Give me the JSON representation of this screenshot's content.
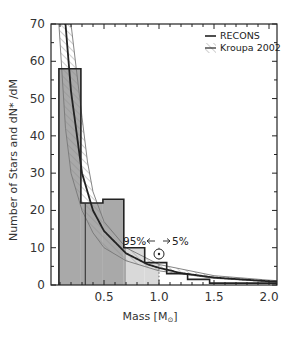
{
  "chart_data": {
    "type": "bar",
    "title": "",
    "xlabel": "Mass [M☉]",
    "ylabel": "Number of Stars and dN* /dM",
    "xlim": [
      0.02,
      2.1
    ],
    "ylim": [
      0,
      70
    ],
    "x_ticks": [
      0.5,
      1.0,
      1.5,
      2.0
    ],
    "x_tick_labels": [
      "0.5",
      "1.0",
      "1.5",
      "2.0"
    ],
    "y_ticks": [
      0,
      10,
      20,
      30,
      40,
      50,
      60,
      70
    ],
    "y_tick_labels": [
      "0",
      "10",
      "20",
      "30",
      "40",
      "50",
      "60",
      "70"
    ],
    "grid": false,
    "legend_position": "top-right",
    "series": [
      {
        "name": "RECONS",
        "kind": "histogram",
        "bin_edges": [
          0.09,
          0.29,
          0.49,
          0.68,
          0.87,
          1.07,
          1.26,
          1.46,
          2.07
        ],
        "values": [
          58,
          22,
          23,
          10,
          6,
          3,
          1.5,
          0.5
        ]
      },
      {
        "name": "RECONS fit",
        "kind": "line",
        "x": [
          0.15,
          0.2,
          0.3,
          0.4,
          0.5,
          0.7,
          0.9,
          1.0,
          1.2,
          1.5,
          2.0,
          2.1
        ],
        "y": [
          70,
          52,
          30,
          20,
          14.5,
          8.5,
          5.5,
          4.6,
          3.2,
          2.0,
          1.0,
          0.9
        ]
      },
      {
        "name": "Kroupa 2002",
        "kind": "band",
        "x": [
          0.09,
          0.15,
          0.2,
          0.3,
          0.35,
          0.4,
          0.5,
          0.7,
          1.0,
          1.5,
          2.0,
          2.1
        ],
        "lower": [
          70,
          42,
          30,
          20,
          17,
          14,
          10,
          6.5,
          3.8,
          1.8,
          0.9,
          0.8
        ],
        "upper": [
          70,
          70,
          70,
          45,
          33,
          25,
          17,
          10,
          5.5,
          2.5,
          1.3,
          1.1
        ]
      }
    ],
    "shaded_regions": [
      {
        "x_from": 0.09,
        "x_to": 0.7,
        "shade": "dark-gray"
      },
      {
        "x_from": 0.7,
        "x_to": 1.0,
        "shade": "light-gray"
      }
    ],
    "annotations": [
      {
        "text": "95%",
        "x": 0.85,
        "y": 11
      },
      {
        "text": "5%",
        "x": 1.15,
        "y": 11
      },
      {
        "text": "⊙",
        "x": 1.0,
        "y": 7.5,
        "note": "Sun symbol at 1 solar mass, dotted vertical line"
      }
    ],
    "vertical_lines": [
      {
        "x": 0.33,
        "style": "solid-thin"
      },
      {
        "x": 1.0,
        "style": "dotted"
      }
    ]
  },
  "legend": {
    "items": [
      {
        "label": "RECONS",
        "swatch": "line"
      },
      {
        "label": "Kroupa 2002",
        "swatch": "hatched"
      }
    ]
  },
  "annotations": {
    "left_pct": "95%",
    "right_pct": "5%",
    "sun_symbol": "⊙"
  },
  "axes": {
    "xlabel_main": "Mass [M",
    "xlabel_sub": "⊙",
    "xlabel_end": "]",
    "ylabel": "Number of Stars and dN* /dM"
  },
  "colors": {
    "dark_fill": "#a9a9a9",
    "light_fill": "#d9d9d9",
    "line": "#222222",
    "hatch": "#8a8a8a"
  }
}
